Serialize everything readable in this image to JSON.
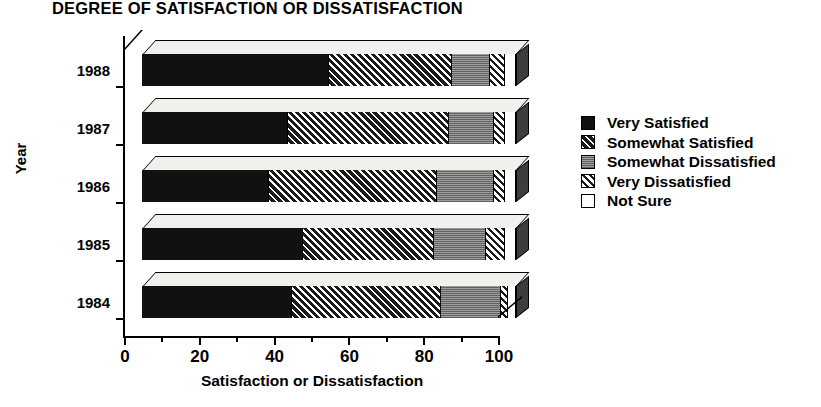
{
  "chart_data": {
    "type": "bar",
    "orientation": "horizontal-stacked-3d",
    "title": "DEGREE OF SATISFACTION OR DISSATISFACTION",
    "xlabel": "Satisfaction or Dissatisfaction",
    "ylabel": "Year",
    "xlim": [
      0,
      100
    ],
    "xticks": [
      0,
      20,
      40,
      60,
      80,
      100
    ],
    "xtick_labels": [
      "0",
      "20",
      "40",
      "60",
      "80",
      "100"
    ],
    "minor_tick_step": 10,
    "grid": false,
    "legend_position": "right",
    "categories": [
      "1988",
      "1987",
      "1986",
      "1985",
      "1984"
    ],
    "series": [
      {
        "name": "Very Satisfied",
        "pattern": "solid-black",
        "color": "#111111",
        "values": [
          50,
          39,
          34,
          43,
          40
        ]
      },
      {
        "name": "Somewhat Satisfied",
        "pattern": "diagonal-hatch",
        "color": "#1a1a1a",
        "values": [
          33,
          43,
          45,
          35,
          40
        ]
      },
      {
        "name": "Somewhat Dissatisfied",
        "pattern": "gray-stipple",
        "color": "#8a8a8a",
        "values": [
          10,
          12,
          15,
          14,
          16
        ]
      },
      {
        "name": "Very Dissatisfied",
        "pattern": "light-diagonal",
        "color": "#ffffff",
        "values": [
          4,
          3,
          3,
          5,
          2
        ]
      },
      {
        "name": "Not Sure",
        "pattern": "white-open",
        "color": "#ffffff",
        "values": [
          3,
          3,
          3,
          3,
          2
        ]
      }
    ]
  },
  "legend": {
    "items": [
      {
        "label": "Very Satisfied"
      },
      {
        "label": "Somewhat Satisfied"
      },
      {
        "label": "Somewhat Dissatisfied"
      },
      {
        "label": "Very Dissatisfied"
      },
      {
        "label": "Not Sure"
      }
    ]
  }
}
